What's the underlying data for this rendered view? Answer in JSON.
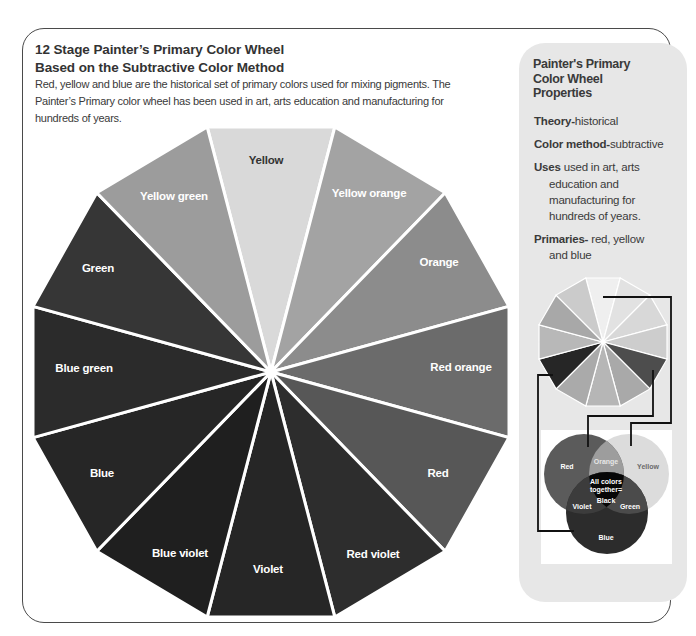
{
  "header": {
    "title_line1": "12 Stage Painter’s Primary Color Wheel",
    "title_line2": "Based on the Subtractive Color Method",
    "description_lines": [
      "Red, yellow and blue are the historical set of primary colors used for mixing pigments. The",
      "Painter’s Primary color wheel has been used in art, arts education and manufacturing for",
      "hundreds of years."
    ]
  },
  "wheel": {
    "segments": [
      {
        "label": "Yellow",
        "color": "#d9d9d9",
        "text_color": "#333333"
      },
      {
        "label": "Yellow orange",
        "color": "#a3a3a3",
        "text_color": "#ffffff"
      },
      {
        "label": "Orange",
        "color": "#8c8c8c",
        "text_color": "#ffffff"
      },
      {
        "label": "Red orange",
        "color": "#6b6b6b",
        "text_color": "#ffffff"
      },
      {
        "label": "Red",
        "color": "#575757",
        "text_color": "#ffffff"
      },
      {
        "label": "Red violet",
        "color": "#2d2d2d",
        "text_color": "#ffffff"
      },
      {
        "label": "Violet",
        "color": "#262626",
        "text_color": "#ffffff"
      },
      {
        "label": "Blue violet",
        "color": "#1f1f1f",
        "text_color": "#ffffff"
      },
      {
        "label": "Blue",
        "color": "#262626",
        "text_color": "#ffffff"
      },
      {
        "label": "Blue green",
        "color": "#2b2b2b",
        "text_color": "#ffffff"
      },
      {
        "label": "Green",
        "color": "#363636",
        "text_color": "#ffffff"
      },
      {
        "label": "Yellow green",
        "color": "#9c9c9c",
        "text_color": "#ffffff"
      }
    ]
  },
  "properties": {
    "heading_lines": [
      "Painter's Primary",
      "Color Wheel",
      "Properties"
    ],
    "items": [
      {
        "key": "Theory-",
        "value_lines": [
          "historical"
        ]
      },
      {
        "key": "Color method-",
        "value_lines": [
          "subtractive"
        ]
      },
      {
        "key": "Uses",
        "value_lines": [
          " used in art, arts",
          "education and",
          "manufacturing for",
          "hundreds of years."
        ]
      },
      {
        "key": "Primaries-",
        "value_lines": [
          " red, yellow",
          "and blue"
        ]
      }
    ]
  },
  "mini_wheel": {
    "segments": [
      {
        "name": "Yellow",
        "color": "#efefef"
      },
      {
        "name": "Yellow orange",
        "color": "#e2e2e2"
      },
      {
        "name": "Orange",
        "color": "#d8d8d8"
      },
      {
        "name": "Red orange",
        "color": "#cdcdcd"
      },
      {
        "name": "Red",
        "color": "#4d4d4d"
      },
      {
        "name": "Red violet",
        "color": "#a9a9a9"
      },
      {
        "name": "Violet",
        "color": "#b6b6b6"
      },
      {
        "name": "Blue violet",
        "color": "#aaaaaa"
      },
      {
        "name": "Blue",
        "color": "#262626"
      },
      {
        "name": "Blue green",
        "color": "#b8b8b8"
      },
      {
        "name": "Green",
        "color": "#a8a8a8"
      },
      {
        "name": "Yellow green",
        "color": "#cbcbcb"
      }
    ]
  },
  "venn": {
    "red": {
      "label": "Red",
      "color": "#5b5b5b",
      "text_color": "#ffffff"
    },
    "yellow": {
      "label": "Yellow",
      "color": "#dcdcdc",
      "text_color": "#6a6a6a"
    },
    "blue": {
      "label": "Blue",
      "color": "#2c2c2c",
      "text_color": "#ffffff"
    },
    "orange": {
      "label": "Orange",
      "color": "#9d9d9d",
      "text_color": "#e6e6e6"
    },
    "violet": {
      "label": "Violet",
      "color": "#3c3c3c",
      "text_color": "#ffffff"
    },
    "green": {
      "label": "Green",
      "color": "#4b4b4b",
      "text_color": "#ffffff"
    },
    "center": {
      "lines": [
        "All colors",
        "together=",
        "Black"
      ],
      "color": "#070707",
      "text_color": "#ffffff"
    }
  },
  "colors": {
    "panel_bg": "#e7e7e7",
    "frame": "#4a4a4a",
    "connector": "#111111"
  }
}
